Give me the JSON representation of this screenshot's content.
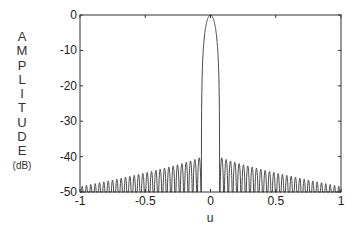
{
  "chart_data": {
    "type": "line",
    "title": "",
    "xlabel": "u",
    "ylabel_letters": [
      "A",
      "M",
      "P",
      "L",
      "I",
      "T",
      "U",
      "D",
      "E"
    ],
    "ylabel_unit": "(dB)",
    "ylabel": "AMPLITUDE (dB)",
    "xlim": [
      -1,
      1
    ],
    "ylim": [
      -50,
      0
    ],
    "xticks": [
      -1,
      -0.5,
      0,
      0.5,
      1
    ],
    "xtick_labels": [
      "-1",
      "-0.5",
      "0",
      "0.5",
      "1"
    ],
    "yticks": [
      0,
      -10,
      -20,
      -30,
      -40,
      -50
    ],
    "ytick_labels": [
      "0",
      "-10",
      "-20",
      "-30",
      "-40",
      "-50"
    ],
    "grid": false,
    "legend": null,
    "series": [
      {
        "name": "array pattern",
        "description": "Symmetric beam pattern: main lobe peak 0 dB at u=0, first nulls near u=±0.07, ~28 sidelobes per side; sidelobe peaks ≈ -40 dB next to main lobe decaying to ≈ -48.5 dB at u=±1; nulls clipped at -50 dB",
        "main_lobe_peak_db": 0,
        "first_null_u": 0.07,
        "sidelobes_per_side": 28,
        "sidelobe_peak_near_mainlobe_db": -40,
        "sidelobe_peak_at_edge_db": -48.5,
        "floor_db": -50
      }
    ]
  }
}
